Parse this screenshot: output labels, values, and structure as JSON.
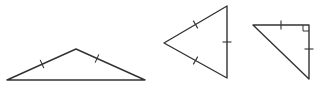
{
  "diagram": {
    "stroke_color": "#333333",
    "background": "#ffffff",
    "triangles": [
      {
        "name": "isosceles-obtuse-triangle",
        "vertices": [
          [
            7,
            80
          ],
          [
            76,
            49
          ],
          [
            145,
            80
          ]
        ],
        "ticks": [
          {
            "x": 42,
            "y": 64,
            "angle": 66
          },
          {
            "x": 97,
            "y": 58.5,
            "angle": -66
          }
        ],
        "right_angle": null
      },
      {
        "name": "equilateral-triangle",
        "vertices": [
          [
            164,
            43
          ],
          [
            227,
            6
          ],
          [
            227,
            78
          ]
        ],
        "ticks": [
          {
            "x": 195.5,
            "y": 24.5,
            "angle": 60
          },
          {
            "x": 195.5,
            "y": 60.5,
            "angle": -60
          },
          {
            "x": 227,
            "y": 42,
            "angle": 0
          }
        ],
        "right_angle": null
      },
      {
        "name": "isosceles-right-triangle",
        "vertices": [
          [
            253,
            25
          ],
          [
            309,
            25
          ],
          [
            309,
            79
          ]
        ],
        "ticks": [
          {
            "x": 281,
            "y": 25,
            "angle": 90
          },
          {
            "x": 309,
            "y": 49,
            "angle": 0
          }
        ],
        "right_angle": {
          "x": 309,
          "y": 25,
          "size": 6
        }
      }
    ]
  }
}
